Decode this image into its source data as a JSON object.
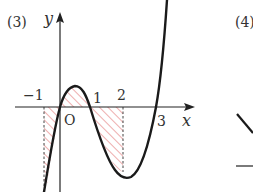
{
  "panel_3": {
    "label": "(3)",
    "y_axis_label": "y",
    "x_axis_label": "x",
    "origin_label": "O",
    "tick_labels": {
      "neg1": "−1",
      "one": "1",
      "two": "2",
      "three": "3"
    },
    "curve": "cubic with roots at x=0 and x=3, local max near x=0.4, local min near x=2.3",
    "shaded_regions": [
      "[-1, 0]",
      "[0, 1]",
      "[1, 2]"
    ],
    "colors": {
      "curve": "#1a1a1a",
      "axis": "#222222",
      "hatch": "#e06a6a",
      "dashed": "#444444"
    }
  },
  "panel_4": {
    "label": "(4)"
  }
}
